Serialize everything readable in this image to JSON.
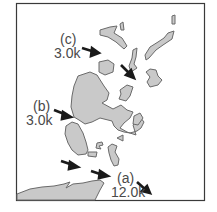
{
  "figure": {
    "type": "map",
    "colors": {
      "land": "#c9c9c9",
      "outline": "#6a6a6a",
      "arrow": "#1a1a1a",
      "text": "#4a4a4a",
      "frame": "#3a3a3a",
      "background": "#ffffff"
    }
  },
  "labels": {
    "a": {
      "tag": "(a)",
      "value": "12.0k"
    },
    "b": {
      "tag": "(b)",
      "value": "3.0k"
    },
    "c": {
      "tag": "(c)",
      "value": "3.0k"
    }
  }
}
